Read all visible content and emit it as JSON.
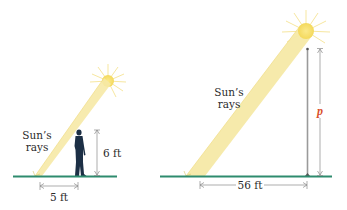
{
  "figure": {
    "left_panel": {
      "sun_rays_label_line1": "Sun’s",
      "sun_rays_label_line2": "rays",
      "person_height_label": "6 ft",
      "shadow_length_label": "5 ft"
    },
    "right_panel": {
      "sun_rays_label_line1": "Sun’s",
      "sun_rays_label_line2": "rays",
      "pole_height_label": "p",
      "shadow_length_label": "56 ft"
    }
  },
  "colors": {
    "ground": "#2e8b6e",
    "sun": "#f7e27a",
    "sun_ray_beam": "#f6e9a6",
    "person": "#1c2f45",
    "pole": "#9a9a9a",
    "dimension_lines": "#8a8a8a",
    "variable_p": "#d9502b"
  }
}
